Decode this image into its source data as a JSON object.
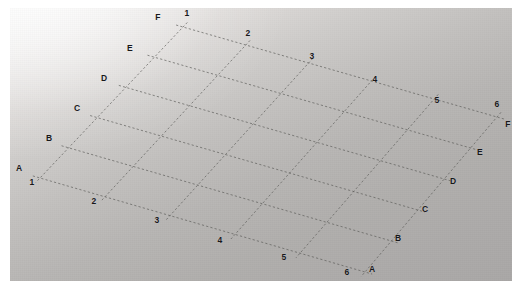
{
  "figure": {
    "background_color": "#ffffff",
    "panel_color_light": "#f4f4f3",
    "panel_color_dark": "#aaa8a7",
    "line_color": "#5a5a58",
    "label_color": "#17171a"
  },
  "grid": {
    "description": "Dashed perspective grid of two intersecting line families forming a rhombus",
    "rows": 6,
    "columns": 6,
    "line_style": "dashed",
    "corners": {
      "top": {
        "x": 183,
        "y": 27
      },
      "left": {
        "x": 40,
        "y": 178
      },
      "right": {
        "x": 497,
        "y": 117
      },
      "bottom": {
        "x": 365,
        "y": 272
      }
    }
  },
  "labels": {
    "left_letters": [
      {
        "text": "F",
        "x": 158,
        "y": 17
      },
      {
        "text": "E",
        "x": 130,
        "y": 48
      },
      {
        "text": "D",
        "x": 104,
        "y": 78
      },
      {
        "text": "C",
        "x": 77,
        "y": 108
      },
      {
        "text": "B",
        "x": 49,
        "y": 138
      },
      {
        "text": "A",
        "x": 19,
        "y": 168
      }
    ],
    "right_letters": [
      {
        "text": "F",
        "x": 508,
        "y": 124
      },
      {
        "text": "E",
        "x": 480,
        "y": 152
      },
      {
        "text": "D",
        "x": 453,
        "y": 181
      },
      {
        "text": "C",
        "x": 425,
        "y": 209
      },
      {
        "text": "B",
        "x": 398,
        "y": 238
      },
      {
        "text": "A",
        "x": 372,
        "y": 269
      }
    ],
    "top_numbers": [
      {
        "text": "1",
        "x": 187,
        "y": 13
      },
      {
        "text": "2",
        "x": 248,
        "y": 33
      },
      {
        "text": "3",
        "x": 312,
        "y": 56
      },
      {
        "text": "4",
        "x": 375,
        "y": 79
      },
      {
        "text": "5",
        "x": 437,
        "y": 100
      },
      {
        "text": "6",
        "x": 497,
        "y": 104
      }
    ],
    "bottom_numbers": [
      {
        "text": "1",
        "x": 32,
        "y": 182
      },
      {
        "text": "2",
        "x": 94,
        "y": 201
      },
      {
        "text": "3",
        "x": 157,
        "y": 220
      },
      {
        "text": "4",
        "x": 220,
        "y": 240
      },
      {
        "text": "5",
        "x": 284,
        "y": 257
      },
      {
        "text": "6",
        "x": 347,
        "y": 272
      }
    ]
  }
}
